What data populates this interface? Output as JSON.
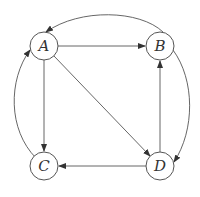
{
  "diagram": {
    "type": "directed-graph",
    "nodes": [
      {
        "id": "A",
        "label": "A"
      },
      {
        "id": "B",
        "label": "B"
      },
      {
        "id": "C",
        "label": "C"
      },
      {
        "id": "D",
        "label": "D"
      }
    ],
    "edges": [
      {
        "from": "A",
        "to": "B",
        "style": "straight"
      },
      {
        "from": "A",
        "to": "C",
        "style": "straight"
      },
      {
        "from": "A",
        "to": "D",
        "style": "straight"
      },
      {
        "from": "D",
        "to": "B",
        "style": "straight"
      },
      {
        "from": "D",
        "to": "C",
        "style": "straight"
      },
      {
        "from": "B",
        "to": "A",
        "style": "curved-top"
      },
      {
        "from": "B",
        "to": "D",
        "style": "curved-right"
      },
      {
        "from": "C",
        "to": "A",
        "style": "curved-left"
      }
    ],
    "colors": {
      "stroke": "#555555",
      "fill": "#ffffff",
      "text": "#333333"
    }
  }
}
